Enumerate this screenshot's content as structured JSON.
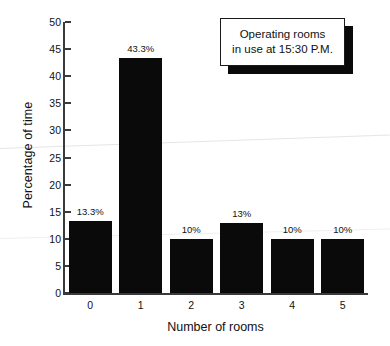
{
  "chart_data": {
    "type": "bar",
    "title": "",
    "xlabel": "Number of rooms",
    "ylabel": "Percentage of time",
    "categories": [
      "0",
      "1",
      "2",
      "3",
      "4",
      "5"
    ],
    "values": [
      13.3,
      43.3,
      10,
      13,
      10,
      10
    ],
    "data_labels": [
      "13.3%",
      "43.3%",
      "10%",
      "13%",
      "10%",
      "10%"
    ],
    "ylim": [
      0,
      50
    ],
    "yticks": [
      0,
      5,
      10,
      15,
      20,
      25,
      30,
      35,
      40,
      45,
      50
    ],
    "ytick_labels": [
      "0",
      "5",
      "10",
      "15",
      "20",
      "25",
      "30",
      "35",
      "40",
      "45",
      "50"
    ],
    "grid": false,
    "legend_position": "top-right",
    "bar_color": "#0a0a0a",
    "axis_color": "#3a3a3a"
  },
  "legend": {
    "line1": "Operating rooms",
    "line2": "in use at 15:30 P.M."
  }
}
